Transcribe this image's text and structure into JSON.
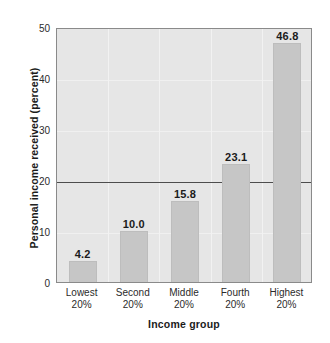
{
  "chart_data": {
    "type": "bar",
    "title": "",
    "xlabel": "Income group",
    "ylabel": "Personal income received (percent)",
    "categories": [
      "Lowest 20%",
      "Second 20%",
      "Middle 20%",
      "Fourth 20%",
      "Highest 20%"
    ],
    "category_lines": [
      [
        "Lowest",
        "20%"
      ],
      [
        "Second",
        "20%"
      ],
      [
        "Middle",
        "20%"
      ],
      [
        "Fourth",
        "20%"
      ],
      [
        "Highest",
        "20%"
      ]
    ],
    "values": [
      4.2,
      10.0,
      15.8,
      23.1,
      46.8
    ],
    "value_labels": [
      "4.2",
      "10.0",
      "15.8",
      "23.1",
      "46.8"
    ],
    "ylim": [
      0,
      50
    ],
    "yticks": [
      0,
      10,
      20,
      30,
      40,
      50
    ],
    "ytick_labels": [
      "0",
      "10",
      "20",
      "30",
      "40",
      "50"
    ],
    "grid": true,
    "legend": "none",
    "reference_line": 20,
    "bar_color": "#c6c6c6",
    "plot_background": "#e6e6e6",
    "axis_color": "#8a8a8a",
    "reference_line_color": "#4d4d4d"
  }
}
